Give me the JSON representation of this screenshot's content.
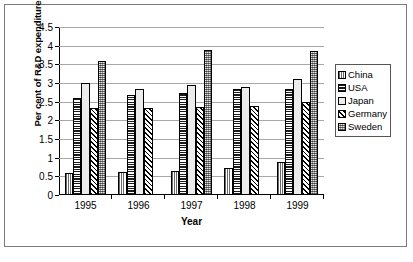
{
  "chart_data": {
    "type": "bar",
    "title": "",
    "xlabel": "Year",
    "ylabel": "Per cent of R&D expenditure",
    "categories": [
      "1995",
      "1996",
      "1997",
      "1998",
      "1999"
    ],
    "ylim": [
      0,
      4.5
    ],
    "yticks": [
      "0",
      "0.5",
      "1",
      "1.5",
      "2",
      "2.5",
      "3",
      "3.5",
      "4",
      "4.5"
    ],
    "ytick_values": [
      0,
      0.5,
      1,
      1.5,
      2,
      2.5,
      3,
      3.5,
      4,
      4.5
    ],
    "grid": true,
    "legend_position": "right",
    "series": [
      {
        "name": "China",
        "pattern": "vertical-lines",
        "values": [
          0.6,
          0.61,
          0.65,
          0.72,
          0.88
        ]
      },
      {
        "name": "USA",
        "pattern": "horizontal-lines",
        "values": [
          2.61,
          2.68,
          2.74,
          2.83,
          2.85
        ]
      },
      {
        "name": "Japan",
        "pattern": "solid-light",
        "values": [
          2.99,
          2.85,
          2.95,
          2.88,
          3.1
        ]
      },
      {
        "name": "Germany",
        "pattern": "diagonal-hatch",
        "values": [
          2.33,
          2.33,
          2.35,
          2.38,
          2.48
        ]
      },
      {
        "name": "Sweden",
        "pattern": "checkered",
        "values": [
          3.6,
          null,
          3.88,
          null,
          3.87
        ]
      }
    ]
  },
  "legend": {
    "items": [
      {
        "label": "China"
      },
      {
        "label": "USA"
      },
      {
        "label": "Japan"
      },
      {
        "label": "Germany"
      },
      {
        "label": "Sweden"
      }
    ]
  }
}
